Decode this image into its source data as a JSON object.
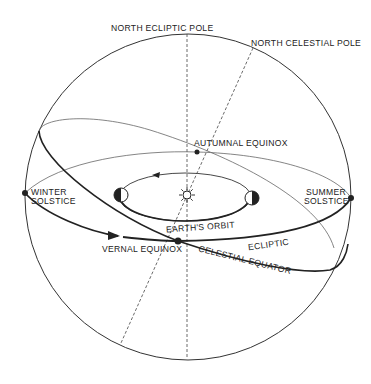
{
  "diagram": {
    "labels": {
      "north_ecliptic_pole": "NORTH ECLIPTIC POLE",
      "north_celestial_pole": "NORTH CELESTIAL POLE",
      "autumnal_equinox": "AUTUMNAL EQUINOX",
      "winter_solstice_1": "WINTER",
      "winter_solstice_2": "SOLSTICE",
      "summer_solstice_1": "SUMMER",
      "summer_solstice_2": "SOLSTICE",
      "earths_orbit": "EARTH'S ORBIT",
      "vernal_equinox": "VERNAL EQUINOX",
      "ecliptic": "ECLIPTIC",
      "celestial_equator": "CELESTIAL EQUATOR"
    },
    "icons": [
      "sun-icon",
      "earth-phase-icon-left",
      "earth-phase-icon-right"
    ],
    "colors": {
      "line": "#222222",
      "thin_line": "#555555",
      "background": "#ffffff"
    }
  }
}
